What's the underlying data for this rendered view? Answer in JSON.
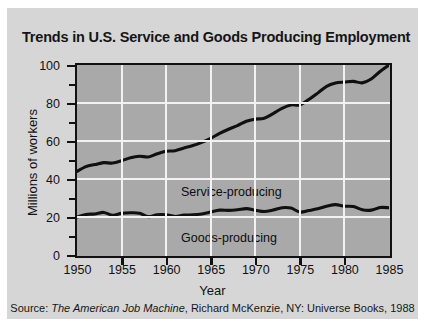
{
  "chart_data": {
    "type": "line",
    "title": "Trends in U.S. Service and Goods Producing Employment",
    "xlabel": "Year",
    "ylabel": "Millions of workers",
    "source": "Source: The American Job Machine, Richard McKenzie, NY: Universe Books, 1988",
    "source_parts": {
      "prefix": "Source: ",
      "italic": "The American Job Machine",
      "suffix": ", Richard McKenzie, NY: Universe Books, 1988"
    },
    "xlim": [
      1950,
      1985
    ],
    "ylim": [
      0,
      100
    ],
    "grid": true,
    "legend_position": "inline-annotation",
    "xticks": [
      1950,
      1955,
      1960,
      1965,
      1970,
      1975,
      1980,
      1985
    ],
    "xtick_labels": [
      "1950",
      "1955",
      "1960",
      "1965",
      "1970",
      "1975",
      "1980",
      "1985"
    ],
    "yticks": [
      0,
      20,
      40,
      60,
      80,
      100
    ],
    "ytick_labels": [
      "0",
      "20",
      "40",
      "60",
      "80",
      "100"
    ],
    "yticks_minor": [
      10,
      30,
      50,
      70,
      90
    ],
    "gridlines_y": [
      20,
      40,
      60,
      80
    ],
    "gridlines_x": [
      1955,
      1960,
      1965,
      1970,
      1975,
      1980
    ],
    "x": [
      1950,
      1951,
      1952,
      1953,
      1954,
      1955,
      1956,
      1957,
      1958,
      1959,
      1960,
      1961,
      1962,
      1963,
      1964,
      1965,
      1966,
      1967,
      1968,
      1969,
      1970,
      1971,
      1972,
      1973,
      1974,
      1975,
      1976,
      1977,
      1978,
      1979,
      1980,
      1981,
      1982,
      1983,
      1984,
      1985
    ],
    "series": [
      {
        "name": "Service-producing",
        "label": "Service-producing",
        "color": "#101010",
        "values": [
          44.0,
          46.5,
          47.6,
          48.6,
          48.4,
          49.6,
          51.2,
          52.0,
          51.6,
          53.3,
          54.6,
          54.9,
          56.3,
          57.6,
          59.3,
          61.4,
          64.0,
          66.2,
          68.1,
          70.4,
          71.5,
          72.0,
          74.4,
          77.2,
          79.0,
          79.0,
          81.8,
          85.2,
          88.8,
          90.5,
          91.0,
          91.4,
          90.6,
          92.6,
          96.6,
          100.0
        ]
      },
      {
        "name": "Goods-producing",
        "label": "Goods-producing",
        "color": "#101010",
        "values": [
          20.0,
          21.3,
          21.6,
          22.4,
          20.9,
          21.9,
          22.2,
          22.0,
          20.2,
          21.2,
          21.2,
          20.3,
          21.0,
          21.1,
          21.6,
          22.6,
          23.6,
          23.5,
          23.8,
          24.4,
          23.6,
          22.9,
          23.7,
          24.9,
          24.7,
          22.6,
          23.4,
          24.3,
          25.6,
          26.5,
          25.7,
          25.5,
          23.8,
          23.6,
          25.0,
          24.9
        ]
      }
    ]
  }
}
